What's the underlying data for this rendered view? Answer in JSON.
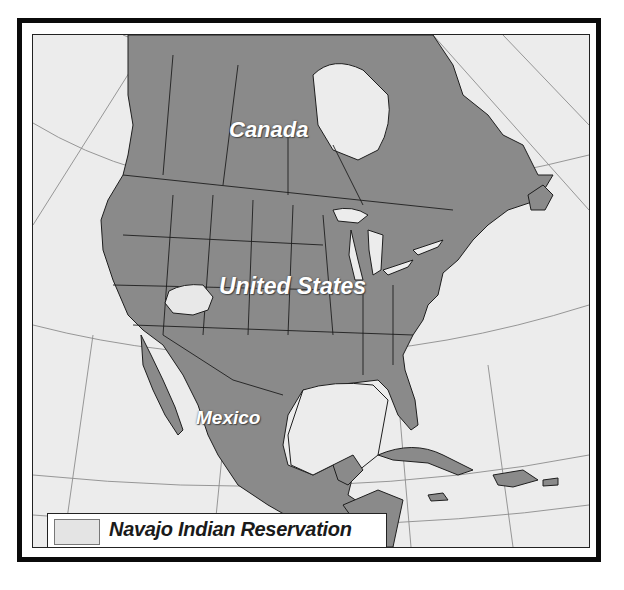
{
  "map": {
    "labels": {
      "canada": "Canada",
      "united_states": "United States",
      "mexico": "Mexico"
    },
    "legend": {
      "label": "Navajo Indian Reservation",
      "swatch_color": "#e4e4e4"
    },
    "colors": {
      "land": "#8a8a8a",
      "water": "#ececec",
      "borders": "#1e1e1e",
      "graticule": "#8c8c8c",
      "highlight": "#e8e8e8",
      "frame": "#0b0b0b"
    }
  }
}
